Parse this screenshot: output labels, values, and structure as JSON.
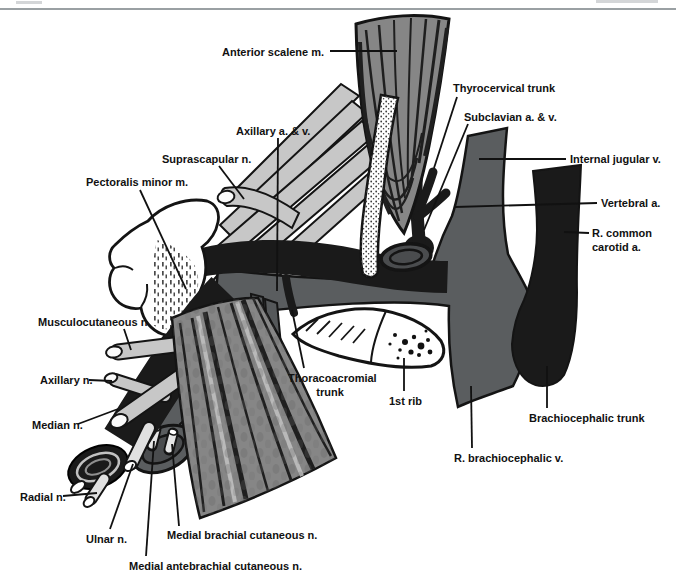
{
  "page": {
    "header_rule": true
  },
  "colors": {
    "background": "#ffffff",
    "outline": "#141414",
    "artery_black": "#1a1a1a",
    "vein_gray": "#5a5d5f",
    "vein_dark_gray": "#4a4c4e",
    "muscle_gray": "#868686",
    "muscle_light_gray": "#b9b9b9",
    "nerve_gray": "#c7c7c7",
    "nerve_light_gray": "#e0e0e0",
    "bone_white": "#ffffff",
    "label_color": "#111111",
    "rule_gray": "#9aa0a3"
  },
  "figure": {
    "labels": [
      {
        "id": "anterior-scalene-m",
        "text": "Anterior scalene m.",
        "left": 222,
        "top": 45,
        "leader": [
          330,
          51,
          397,
          51
        ]
      },
      {
        "id": "axillary-a-v",
        "text": "Axillary a. & v.",
        "left": 236,
        "top": 124,
        "leader": [
          278,
          138,
          277,
          291
        ]
      },
      {
        "id": "suprascapular-n",
        "text": "Suprascapular n.",
        "left": 162,
        "top": 152,
        "leader": [
          219,
          166,
          244,
          199
        ]
      },
      {
        "id": "pectoralis-minor-m",
        "text": "Pectoralis minor m.",
        "left": 86,
        "top": 175,
        "leader": [
          140,
          190,
          186,
          289
        ]
      },
      {
        "id": "thyrocervical-trunk",
        "text": "Thyrocervical trunk",
        "left": 453,
        "top": 81,
        "leader": [
          457,
          97,
          434,
          168
        ]
      },
      {
        "id": "subclavian-a-v",
        "text": "Subclavian a. & v.",
        "left": 464,
        "top": 110,
        "leader": [
          468,
          124,
          424,
          230
        ]
      },
      {
        "id": "internal-jugular-v",
        "text": "Internal jugular v.",
        "left": 570,
        "top": 152,
        "leader": [
          566,
          159,
          479,
          159
        ]
      },
      {
        "id": "vertebral-a",
        "text": "Vertebral a.",
        "left": 601,
        "top": 196,
        "leader": [
          597,
          203,
          455,
          207
        ]
      },
      {
        "id": "r-common-carotid-a",
        "text": "R. common\ncarotid a.",
        "left": 592,
        "top": 226,
        "leader": [
          589,
          233,
          564,
          232
        ]
      },
      {
        "id": "musculocutaneous-n",
        "text": "Musculocutaneous n.",
        "left": 38,
        "top": 315,
        "leader": [
          124,
          329,
          131,
          350
        ]
      },
      {
        "id": "axillary-n",
        "text": "Axillary n.",
        "left": 40,
        "top": 373,
        "leader": [
          89,
          380,
          112,
          381
        ]
      },
      {
        "id": "median-n",
        "text": "Median n.",
        "left": 32,
        "top": 418,
        "leader": [
          78,
          424,
          118,
          409
        ]
      },
      {
        "id": "thoracoacromial-trunk",
        "text": "Thoracoacromial\ntrunk",
        "left": 288,
        "top": 371,
        "width": 84,
        "align": "center",
        "leader": [
          304,
          368,
          292,
          310
        ]
      },
      {
        "id": "first-rib",
        "text": "1st rib",
        "left": 389,
        "top": 394,
        "leader": [
          404,
          391,
          404,
          358
        ]
      },
      {
        "id": "radial-n",
        "text": "Radial n.",
        "left": 20,
        "top": 490,
        "leader": [
          63,
          496,
          97,
          493
        ]
      },
      {
        "id": "ulnar-n",
        "text": "Ulnar n.",
        "left": 86,
        "top": 532,
        "leader": [
          110,
          529,
          133,
          464
        ]
      },
      {
        "id": "medial-brachial-cutaneous-n",
        "text": "Medial brachial cutaneous n.",
        "left": 167,
        "top": 528,
        "leader": [
          179,
          526,
          172,
          444
        ]
      },
      {
        "id": "medial-antebrachial-cutaneous-n",
        "text": "Medial antebrachial cutaneous n.",
        "left": 129,
        "top": 559,
        "leader": [
          146,
          556,
          154,
          441
        ]
      },
      {
        "id": "brachiocephalic-trunk",
        "text": "Brachiocephalic trunk",
        "left": 529,
        "top": 411,
        "leader": [
          547,
          408,
          547,
          366
        ]
      },
      {
        "id": "r-brachiocephalic-v",
        "text": "R. brachiocephalic v.",
        "left": 454,
        "top": 451,
        "leader": [
          472,
          448,
          471,
          386
        ]
      }
    ]
  }
}
